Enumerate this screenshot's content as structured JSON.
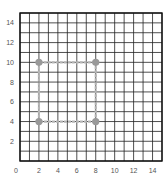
{
  "chart_data": {
    "type": "scatter",
    "title": "",
    "xlabel": "",
    "ylabel": "",
    "xlim": [
      0,
      15
    ],
    "ylim": [
      0,
      15
    ],
    "grid": true,
    "grid_step": 1,
    "x_ticks": [
      0,
      2,
      4,
      6,
      8,
      10,
      12,
      14
    ],
    "y_ticks": [
      2,
      4,
      6,
      8,
      10,
      12,
      14
    ],
    "series": [
      {
        "name": "square",
        "closed": true,
        "color": "#999999",
        "line_color": "#b5b5b5",
        "points": [
          {
            "x": 2,
            "y": 4
          },
          {
            "x": 2,
            "y": 10
          },
          {
            "x": 8,
            "y": 10
          },
          {
            "x": 8,
            "y": 4
          }
        ]
      }
    ]
  },
  "colors": {
    "grid": "#222222",
    "border": "#111111",
    "tick_label": "#555555"
  },
  "layout": {
    "plot_left": 20,
    "plot_top": 13,
    "plot_right": 162,
    "plot_bottom": 161
  }
}
